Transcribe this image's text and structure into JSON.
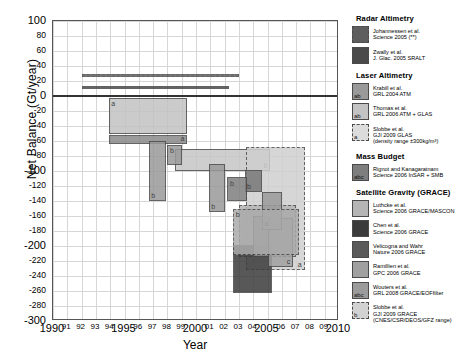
{
  "chart_data": {
    "type": "bar",
    "title": "",
    "xlabel": "Year",
    "ylabel": "Net Balance (Gt/year)",
    "xlim": [
      1990,
      2010
    ],
    "ylim": [
      -300,
      100
    ],
    "ytick_step": 20,
    "grid": true,
    "legend_position": "right",
    "yticks": [
      "100",
      "80",
      "60",
      "40",
      "20",
      "0",
      "-20",
      "-40",
      "-60",
      "-80",
      "-100",
      "-120",
      "-140",
      "-160",
      "-180",
      "-200",
      "-220",
      "-240",
      "-260",
      "-280",
      "-300"
    ],
    "ymajor": [
      "100",
      "0",
      "-100",
      "-200",
      "-300"
    ],
    "xticks": [
      "1990",
      "91",
      "92",
      "93",
      "94",
      "1995",
      "96",
      "97",
      "98",
      "99",
      "2000",
      "01",
      "02",
      "03",
      "04",
      "2005",
      "06",
      "07",
      "08",
      "09",
      "2010"
    ],
    "xmajor": [
      "1990",
      "1995",
      "2000",
      "2005",
      "2010"
    ],
    "series": [
      {
        "name": "Johannessen et al. Science 2005 (**)",
        "group": "Radar Altimetry",
        "x0": 1992.0,
        "x1": 2003.0,
        "y0": 26,
        "y1": 30,
        "color": "#5e5e5e",
        "border": "dashed",
        "tag": ""
      },
      {
        "name": "Zwally et al. J. Glac. 2005 SRALT",
        "group": "Radar Altimetry",
        "x0": 1992.0,
        "x1": 2002.3,
        "y0": 9,
        "y1": 13,
        "color": "#4a4a4a",
        "border": "solid",
        "tag": ""
      },
      {
        "name": "Krabill et al. GRL 2004 ATM",
        "group": "Laser Altimetry",
        "x0": 1993.9,
        "x1": 1999.4,
        "y0": -52,
        "y1": -64,
        "color": "#8a8a8a",
        "border": "solid",
        "tag": "a"
      },
      {
        "name": "Krabill et al. GRL 2004 ATM (b)",
        "group": "Laser Altimetry",
        "x0": 1996.7,
        "x1": 1997.9,
        "y0": -60,
        "y1": -140,
        "color": "#9a9a9a",
        "border": "solid",
        "tag": "b"
      },
      {
        "name": "Thomas et al. GRL 2006 ATM + GLAS",
        "group": "Laser Altimetry",
        "x0": 1993.9,
        "x1": 1999.4,
        "y0": -2,
        "y1": -50,
        "color": "#c3c3c3",
        "border": "solid",
        "tag": "a"
      },
      {
        "name": "Thomas et al. GRL 2006 ATM + GLAS (b)",
        "group": "Laser Altimetry",
        "x0": 1998.5,
        "x1": 2005.2,
        "y0": -70,
        "y1": -100,
        "color": "#c6c6c6",
        "border": "solid",
        "tag": "b"
      },
      {
        "name": "Thomas b2",
        "group": "Laser Altimetry",
        "x0": 1998.0,
        "x1": 1999.0,
        "y0": -65,
        "y1": -92,
        "color": "#9a9a9a",
        "border": "solid",
        "tag": "b"
      },
      {
        "name": "Thomas b3",
        "group": "Laser Altimetry",
        "x0": 2000.9,
        "x1": 2002.0,
        "y0": -90,
        "y1": -155,
        "color": "#9a9a9a",
        "border": "solid",
        "tag": "b"
      },
      {
        "name": "Slobbe et al. GJI 2009 GLAS (density range)",
        "group": "Laser Altimetry",
        "x0": 2003.5,
        "x1": 2007.6,
        "y0": -68,
        "y1": -232,
        "color": "#cfcfcf",
        "border": "dashed",
        "tag": "a"
      },
      {
        "name": "Rignot and Kanagaratnam Science 2006 InSAR + SMB",
        "group": "Mass Budget",
        "x0": 2003.4,
        "x1": 2004.6,
        "y0": -98,
        "y1": -128,
        "color": "#787878",
        "border": "solid",
        "tag": "b"
      },
      {
        "name": "Rignot b2",
        "group": "Mass Budget",
        "x0": 2002.2,
        "x1": 2003.6,
        "y0": -108,
        "y1": -140,
        "color": "#7e7e7e",
        "border": "solid",
        "tag": "b"
      },
      {
        "name": "Luthcke et al. Science 2006 GRACE/MASCON",
        "group": "Satellite Gravity (GRACE)",
        "x0": 2003.0,
        "x1": 2007.0,
        "y0": -145,
        "y1": -215,
        "color": "#b5b5b5",
        "border": "dashed",
        "tag": "a"
      },
      {
        "name": "Chen et al. Science 2006 GRACE",
        "group": "Satellite Gravity (GRACE)",
        "x0": 2002.6,
        "x1": 2005.3,
        "y0": -198,
        "y1": -262,
        "color": "#3b3b3b",
        "border": "solid",
        "tag": "c"
      },
      {
        "name": "Velicogna and Wahr Nature 2006 GRACE",
        "group": "Satellite Gravity (GRACE)",
        "x0": 2004.0,
        "x1": 2005.2,
        "y0": -160,
        "y1": -215,
        "color": "#8d8d8d",
        "border": "solid",
        "tag": ""
      },
      {
        "name": "Ramillien et al. GPC 2006 GRACE",
        "group": "Satellite Gravity (GRACE)",
        "x0": 2005.0,
        "x1": 2006.8,
        "y0": -162,
        "y1": -228,
        "color": "#a0a0a0",
        "border": "solid",
        "tag": "c"
      },
      {
        "name": "Wouters et al. GRL 2008 GRACE/EOF filter",
        "group": "Satellite Gravity (GRACE)",
        "x0": 2004.6,
        "x1": 2006.0,
        "y0": -128,
        "y1": -178,
        "color": "#9b9b9b",
        "border": "solid",
        "tag": "a"
      },
      {
        "name": "Slobbe et al. GJI 2009 GRACE (CNES/CSR/DEOS/GFZ range)",
        "group": "Satellite Gravity (GRACE)",
        "x0": 2002.6,
        "x1": 2007.2,
        "y0": -150,
        "y1": -212,
        "color": "#ababab",
        "border": "dashed",
        "tag": "b"
      }
    ]
  },
  "legend": {
    "sections": [
      {
        "title": "Radar Altimetry",
        "entries": [
          {
            "tag": "",
            "color": "#5e5e5e",
            "border": "dashed",
            "lines": [
              "Johannessen et al.",
              "Science 2005 (**)"
            ]
          },
          {
            "tag": "",
            "color": "#4a4a4a",
            "border": "solid",
            "lines": [
              "Zwally et al.",
              "J. Glac. 2005 SRALT"
            ]
          }
        ]
      },
      {
        "title": "Laser Altimetry",
        "entries": [
          {
            "tag": "ab",
            "color": "#9a9a9a",
            "border": "solid",
            "lines": [
              "Krabill et al.",
              "GRL 2004  ATM"
            ]
          },
          {
            "tag": "ab",
            "color": "#c3c3c3",
            "border": "solid",
            "lines": [
              "Thomas et al.",
              "GRL 2006  ATM + GLAS"
            ]
          },
          {
            "tag": "a",
            "color": "#dcdcdc",
            "border": "dashed",
            "lines": [
              "Slobbe et al.",
              "GJI 2009 GLAS",
              "(density range ±300kg/m³)"
            ]
          }
        ]
      },
      {
        "title": "Mass Budget",
        "entries": [
          {
            "tag": "abc",
            "color": "#7e7e7e",
            "border": "solid",
            "lines": [
              "Rignot and Kanagaratnam",
              "Science 2006 InSAR + SMB"
            ]
          }
        ]
      },
      {
        "title": "Satellite Gravity (GRACE)",
        "entries": [
          {
            "tag": "",
            "color": "#b5b5b5",
            "border": "solid",
            "lines": [
              "Luthcke et al.",
              "Science 2006 GRACE/MASCON"
            ]
          },
          {
            "tag": "",
            "color": "#3b3b3b",
            "border": "solid",
            "lines": [
              "Chen et al.",
              "Science 2006 GRACE"
            ]
          },
          {
            "tag": "",
            "color": "#5a5a5a",
            "border": "solid",
            "lines": [
              "Velicogna and Wahr",
              "Nature 2006  GRACE"
            ]
          },
          {
            "tag": "",
            "color": "#a0a0a0",
            "border": "solid",
            "lines": [
              "Ramillien et al.",
              "GPC 2006 GRACE"
            ]
          },
          {
            "tag": "abc",
            "color": "#9b9b9b",
            "border": "solid",
            "lines": [
              "Wouters et al.",
              "GRL 2008 GRACE/EOFfilter"
            ]
          },
          {
            "tag": "b",
            "color": "#d2d2d2",
            "border": "dashed",
            "lines": [
              "Slobbe et al.",
              "GJI 2009 GRACE",
              "(CNES/CSR/DEOS/GFZ range)"
            ]
          }
        ]
      }
    ]
  }
}
